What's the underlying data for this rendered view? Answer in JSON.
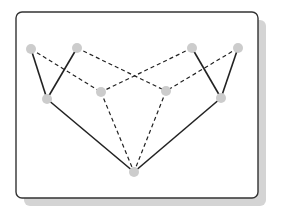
{
  "diagram": {
    "type": "graph",
    "frame": {
      "x": 16,
      "y": 12,
      "width": 242,
      "height": 186,
      "radius": 6,
      "stroke": "#333333",
      "fill": "#ffffff",
      "shadow": {
        "dx": 8,
        "dy": 8,
        "color": "#d4d4d4"
      }
    },
    "node_style": {
      "fill": "#cccccc",
      "r": 5
    },
    "nodes": [
      {
        "id": "top-1",
        "x": 31,
        "y": 49
      },
      {
        "id": "top-2",
        "x": 77,
        "y": 48
      },
      {
        "id": "top-3",
        "x": 192,
        "y": 48
      },
      {
        "id": "top-4",
        "x": 238,
        "y": 48
      },
      {
        "id": "mid-left",
        "x": 47,
        "y": 99
      },
      {
        "id": "mid-inner-left",
        "x": 101,
        "y": 92
      },
      {
        "id": "mid-inner-right",
        "x": 166,
        "y": 91
      },
      {
        "id": "mid-right",
        "x": 221,
        "y": 98
      },
      {
        "id": "bottom",
        "x": 134,
        "y": 172
      }
    ],
    "edges": [
      {
        "from": "top-1",
        "to": "mid-left",
        "style": "solid"
      },
      {
        "from": "top-2",
        "to": "mid-left",
        "style": "solid"
      },
      {
        "from": "top-3",
        "to": "mid-right",
        "style": "solid"
      },
      {
        "from": "top-4",
        "to": "mid-right",
        "style": "solid"
      },
      {
        "from": "mid-left",
        "to": "bottom",
        "style": "solid"
      },
      {
        "from": "mid-right",
        "to": "bottom",
        "style": "solid"
      },
      {
        "from": "top-1",
        "to": "mid-inner-left",
        "style": "dashed"
      },
      {
        "from": "top-3",
        "to": "mid-inner-left",
        "style": "dashed"
      },
      {
        "from": "top-2",
        "to": "mid-inner-right",
        "style": "dashed"
      },
      {
        "from": "top-4",
        "to": "mid-inner-right",
        "style": "dashed"
      },
      {
        "from": "mid-inner-left",
        "to": "bottom",
        "style": "dashed"
      },
      {
        "from": "mid-inner-right",
        "to": "bottom",
        "style": "dashed"
      }
    ],
    "edge_style": {
      "stroke": "#222222",
      "solid_width": 1.6,
      "dashed_width": 1.2,
      "dasharray": "4 3"
    }
  }
}
